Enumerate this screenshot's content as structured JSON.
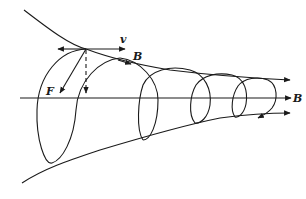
{
  "diagram": {
    "type": "physics-magnetic-field-spiral",
    "labels": {
      "velocity": "v",
      "field_line_label": "B",
      "axis_label": "B",
      "force": "F"
    },
    "colors": {
      "stroke": "#1a1a1a",
      "background": "#ffffff"
    }
  }
}
